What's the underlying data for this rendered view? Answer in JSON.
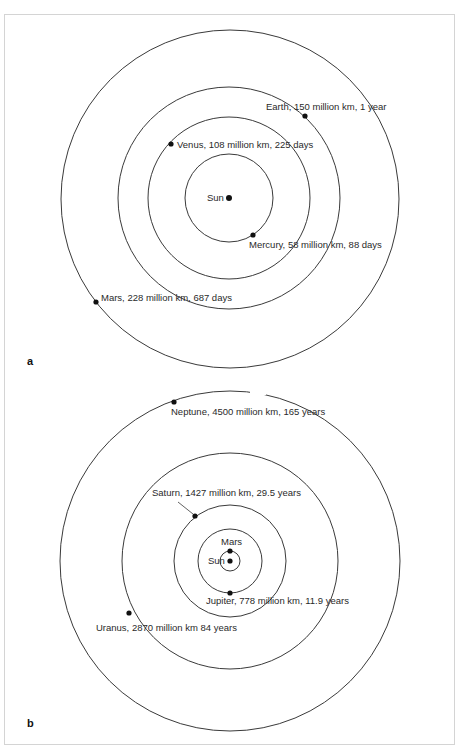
{
  "figure": {
    "panels": [
      {
        "letter": "a",
        "center_label": "Sun",
        "planets": [
          {
            "name": "Mercury",
            "label": "Mercury, 58 million km, 88 days",
            "distance_million_km": 58,
            "period": "88 days"
          },
          {
            "name": "Venus",
            "label": "Venus, 108 million km, 225 days",
            "distance_million_km": 108,
            "period": "225 days"
          },
          {
            "name": "Earth",
            "label": "Earth, 150 million km, 1 year",
            "distance_million_km": 150,
            "period": "1 year"
          },
          {
            "name": "Mars",
            "label": "Mars, 228 million km, 687 days",
            "distance_million_km": 228,
            "period": "687 days"
          }
        ]
      },
      {
        "letter": "b",
        "center_label": "Sun",
        "planets": [
          {
            "name": "Mars",
            "label": "Mars"
          },
          {
            "name": "Jupiter",
            "label": "Jupiter, 778 million km, 11.9 years",
            "distance_million_km": 778,
            "period": "11.9 years"
          },
          {
            "name": "Saturn",
            "label": "Saturn, 1427 million km, 29.5 years",
            "distance_million_km": 1427,
            "period": "29.5 years"
          },
          {
            "name": "Uranus",
            "label": "Uranus, 2870 million km 84 years",
            "distance_million_km": 2870,
            "period": "84 years"
          },
          {
            "name": "Neptune",
            "label": "Neptune, 4500 million km, 165 years",
            "distance_million_km": 4500,
            "period": "165 years"
          }
        ]
      }
    ],
    "colors": {
      "line": "#3a3a3a",
      "planet": "#111111",
      "border": "#d4d4d4"
    }
  }
}
